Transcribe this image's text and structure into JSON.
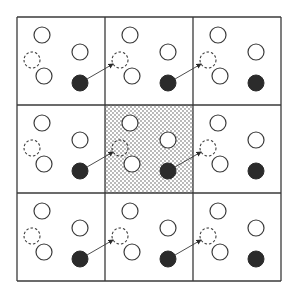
{
  "diagram": {
    "grid": {
      "rows": 3,
      "cols": 3,
      "origin": [
        17,
        17
      ],
      "cell_size": 88
    },
    "shaded_cell": {
      "row": 1,
      "col": 1
    },
    "colors": {
      "line": "#3a3a3a",
      "filled": "#2b2b2b",
      "shade_dot": "#9a9a9a",
      "background": "#ffffff"
    },
    "cell_contents": {
      "open_circles": [
        [
          25,
          18
        ],
        [
          63,
          35
        ],
        [
          27,
          59
        ]
      ],
      "dashed_circle": [
        15,
        43
      ],
      "filled_circle": [
        63,
        66
      ],
      "radius": 8
    },
    "arrow": {
      "from_cell_offset": [
        70,
        62
      ],
      "to_next_cell_offset": [
        8,
        47
      ]
    }
  }
}
